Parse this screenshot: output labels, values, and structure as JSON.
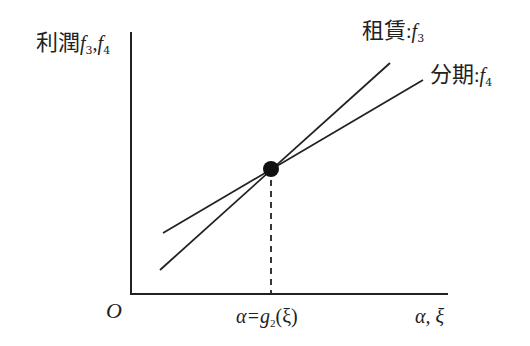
{
  "diagram": {
    "y_axis_label": {
      "prefix": "利潤",
      "f_a": "f",
      "sub_a": "3",
      "sep": ",",
      "f_b": "f",
      "sub_b": "4"
    },
    "origin_label": "O",
    "x_axis_label": "α, ξ",
    "intersection_label": {
      "lhs": "α=g",
      "sub": "2",
      "rhs": "(ξ)"
    },
    "lines": [
      {
        "name": "租賃",
        "func": "f",
        "sub": "3",
        "x1": 160,
        "y1": 270,
        "x2": 390,
        "y2": 63
      },
      {
        "name": "分期",
        "func": "f",
        "sub": "4",
        "x1": 163,
        "y1": 233,
        "x2": 423,
        "y2": 80
      }
    ],
    "intersection_point": {
      "cx": 271,
      "cy": 169,
      "r": 8
    },
    "axes": {
      "origin_x": 131,
      "origin_y": 294,
      "x_end": 448,
      "y_top": 32
    },
    "colors": {
      "stroke": "#222222",
      "background": "#ffffff"
    }
  }
}
